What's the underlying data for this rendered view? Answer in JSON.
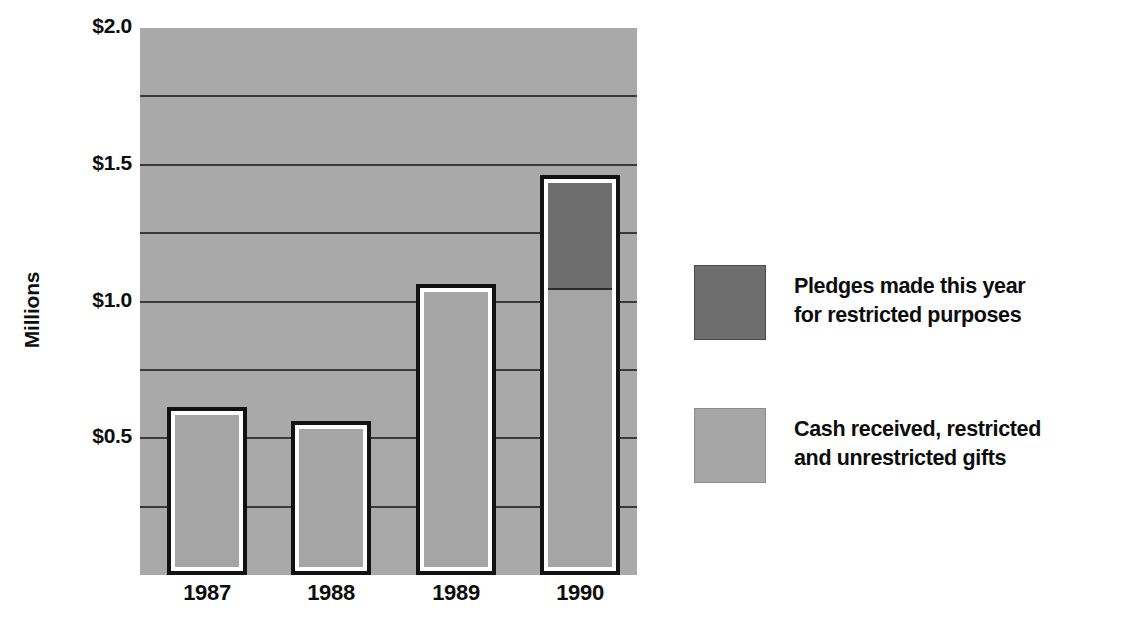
{
  "chart_data": {
    "type": "bar",
    "title": "",
    "subtitle": "",
    "xlabel": "",
    "ylabel": "Millions",
    "categories": [
      "1987",
      "1988",
      "1989",
      "1990"
    ],
    "ylim": [
      0,
      2.0
    ],
    "y_tick_labels": [
      "$2.0",
      "$1.5",
      "$1.0",
      "$0.5"
    ],
    "y_tick_values": [
      2.0,
      1.5,
      1.0,
      0.5
    ],
    "gridlines": [
      2.0,
      1.75,
      1.5,
      1.25,
      1.0,
      0.75,
      0.5,
      0.25
    ],
    "grid": true,
    "stacked": true,
    "legend_position": "right",
    "series": [
      {
        "name": "Pledges made this year for restricted purposes",
        "color": "#6e6e6e",
        "values": [
          0,
          0,
          0,
          0.39
        ]
      },
      {
        "name": "Cash received, restricted and unrestricted gifts",
        "color": "#a5a5a5",
        "values": [
          0.58,
          0.53,
          1.03,
          1.04
        ]
      }
    ],
    "totals": [
      0.58,
      0.53,
      1.03,
      1.43
    ],
    "value_unit": "Millions of dollars",
    "plot_background": "#a9a9a9",
    "bar_border_color": "#121212",
    "bar_gap_color": "#ffffff"
  },
  "axes": {
    "y_title": "Millions",
    "y_ticks": [
      {
        "label": "$2.0",
        "value": 2.0
      },
      {
        "label": "$1.5",
        "value": 1.5
      },
      {
        "label": "$1.0",
        "value": 1.0
      },
      {
        "label": "$0.5",
        "value": 0.5
      }
    ],
    "x_ticks": [
      {
        "label": "1987"
      },
      {
        "label": "1988"
      },
      {
        "label": "1989"
      },
      {
        "label": "1990"
      }
    ]
  },
  "legend": {
    "entries": [
      {
        "swatch": "dark-gray-swatch",
        "color": "#6e6e6e",
        "line1": "Pledges made this year",
        "line2": "for restricted purposes"
      },
      {
        "swatch": "light-gray-swatch",
        "color": "#a5a5a5",
        "line1": "Cash received, restricted",
        "line2": "and unrestricted gifts"
      }
    ]
  }
}
